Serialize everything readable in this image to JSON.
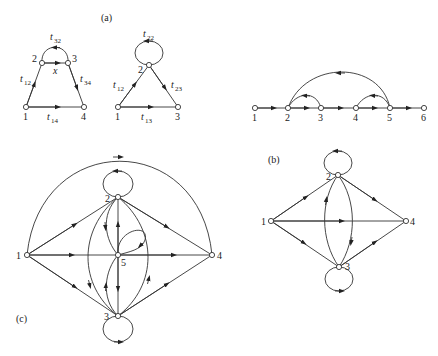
{
  "figure": {
    "panel_a_label": "(a)",
    "panel_b_label": "(b)",
    "panel_c_label": "(c)"
  },
  "graph_a1": {
    "nodes": [
      "1",
      "2",
      "3",
      "4"
    ],
    "edges": [
      {
        "from": "1",
        "to": "2",
        "label": "t",
        "sub": "12"
      },
      {
        "from": "2",
        "to": "3",
        "label": "x",
        "sub": ""
      },
      {
        "from": "3",
        "to": "2",
        "label": "t",
        "sub": "32"
      },
      {
        "from": "3",
        "to": "4",
        "label": "t",
        "sub": "34"
      },
      {
        "from": "1",
        "to": "4",
        "label": "t",
        "sub": "14"
      }
    ]
  },
  "graph_a2": {
    "nodes": [
      "1",
      "2",
      "3"
    ],
    "edges": [
      {
        "from": "1",
        "to": "2",
        "label": "t",
        "sub": "12"
      },
      {
        "from": "2",
        "to": "2",
        "label": "t",
        "sub": "22"
      },
      {
        "from": "2",
        "to": "3",
        "label": "t",
        "sub": "23"
      },
      {
        "from": "1",
        "to": "3",
        "label": "t",
        "sub": "13"
      }
    ]
  },
  "graph_chain": {
    "nodes": [
      "1",
      "2",
      "3",
      "4",
      "5",
      "6"
    ]
  },
  "graph_b": {
    "nodes": [
      "1",
      "2",
      "3",
      "4"
    ]
  },
  "graph_c": {
    "nodes": [
      "1",
      "2",
      "3",
      "4",
      "5"
    ]
  }
}
